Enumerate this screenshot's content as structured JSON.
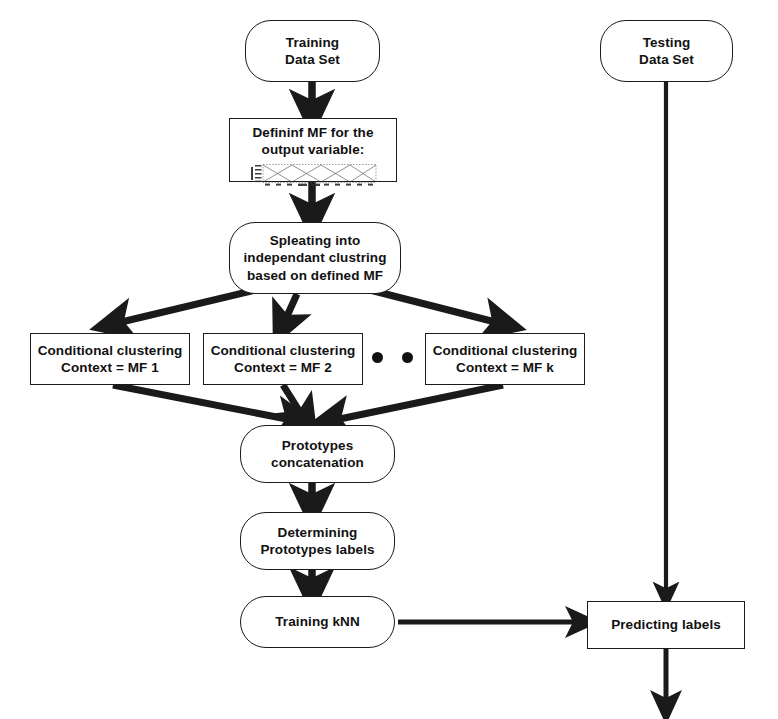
{
  "diagram": {
    "background": "#ffffff",
    "stroke": "#1a1a1a",
    "text_color": "#111111"
  },
  "nodes": {
    "training_data_set": {
      "label_lines": [
        "Training",
        "Data Set"
      ],
      "shape": "stadium",
      "x": 245,
      "y": 20,
      "w": 135,
      "h": 62
    },
    "defining_mf": {
      "label_lines": [
        "Defininf MF for the",
        "output variable:"
      ],
      "shape": "rectangle",
      "x": 229,
      "y": 118,
      "w": 168,
      "h": 64
    },
    "splitting": {
      "label_lines": [
        "Spleating into",
        "independant clustring",
        "based on defined MF"
      ],
      "shape": "stadium",
      "x": 229,
      "y": 222,
      "w": 172,
      "h": 72
    },
    "cluster_mf1": {
      "label_lines": [
        "Conditional clustering",
        "Context = MF 1"
      ],
      "shape": "rectangle",
      "x": 30,
      "y": 333,
      "w": 160,
      "h": 52
    },
    "cluster_mf2": {
      "label_lines": [
        "Conditional clustering",
        "Context = MF 2"
      ],
      "shape": "rectangle",
      "x": 203,
      "y": 333,
      "w": 160,
      "h": 52
    },
    "cluster_mfk": {
      "label_lines": [
        "Conditional clustering",
        "Context = MF k"
      ],
      "shape": "rectangle",
      "x": 425,
      "y": 333,
      "w": 160,
      "h": 52
    },
    "ellipsis": {
      "dot_count": 3,
      "x": 372,
      "y": 352
    },
    "prototypes_concat": {
      "label_lines": [
        "Prototypes",
        "concatenation"
      ],
      "shape": "stadium",
      "x": 240,
      "y": 425,
      "w": 155,
      "h": 58
    },
    "determining_labels": {
      "label_lines": [
        "Determining",
        "Prototypes labels"
      ],
      "shape": "stadium",
      "x": 240,
      "y": 512,
      "w": 155,
      "h": 58
    },
    "training_knn": {
      "label_lines": [
        "Training kNN"
      ],
      "shape": "stadium",
      "x": 240,
      "y": 596,
      "w": 155,
      "h": 52
    },
    "testing_data_set": {
      "label_lines": [
        "Testing",
        "Data Set"
      ],
      "shape": "stadium",
      "x": 600,
      "y": 20,
      "w": 133,
      "h": 62
    },
    "predicting_labels": {
      "label_lines": [
        "Predicting labels"
      ],
      "shape": "rectangle",
      "x": 587,
      "y": 601,
      "w": 158,
      "h": 48
    }
  },
  "mf_plot": {
    "description": "small embedded membership function plot",
    "y_axis_label": "Degree",
    "series_count": 3,
    "curve_shape": "triangular crossing membership functions"
  },
  "edges": [
    {
      "name": "training-to-defining",
      "from": "training_data_set",
      "to": "defining_mf",
      "kind": "vertical-arrow"
    },
    {
      "name": "defining-to-splitting",
      "from": "defining_mf",
      "to": "splitting",
      "kind": "vertical-arrow"
    },
    {
      "name": "splitting-to-mf1",
      "from": "splitting",
      "to": "cluster_mf1",
      "kind": "diagonal-arrow"
    },
    {
      "name": "splitting-to-mf2",
      "from": "splitting",
      "to": "cluster_mf2",
      "kind": "diagonal-arrow"
    },
    {
      "name": "splitting-to-mfk",
      "from": "splitting",
      "to": "cluster_mfk",
      "kind": "diagonal-arrow"
    },
    {
      "name": "mf1-to-concat",
      "from": "cluster_mf1",
      "to": "prototypes_concat",
      "kind": "diagonal-arrow"
    },
    {
      "name": "mf2-to-concat",
      "from": "cluster_mf2",
      "to": "prototypes_concat",
      "kind": "diagonal-arrow"
    },
    {
      "name": "mfk-to-concat",
      "from": "cluster_mfk",
      "to": "prototypes_concat",
      "kind": "diagonal-arrow"
    },
    {
      "name": "concat-to-determining",
      "from": "prototypes_concat",
      "to": "determining_labels",
      "kind": "vertical-arrow"
    },
    {
      "name": "determining-to-knn",
      "from": "determining_labels",
      "to": "training_knn",
      "kind": "vertical-arrow"
    },
    {
      "name": "knn-to-predicting",
      "from": "training_knn",
      "to": "predicting_labels",
      "kind": "horizontal-arrow"
    },
    {
      "name": "testing-to-predicting",
      "from": "testing_data_set",
      "to": "predicting_labels",
      "kind": "vertical-arrow"
    },
    {
      "name": "predicting-output",
      "from": "predicting_labels",
      "to": null,
      "kind": "vertical-arrow"
    }
  ]
}
